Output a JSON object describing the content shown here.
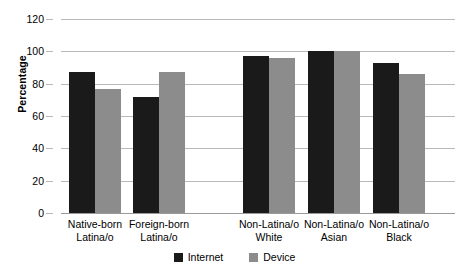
{
  "chart_data": {
    "type": "bar",
    "title": "",
    "xlabel": "",
    "ylabel": "Percentage",
    "ylim": [
      0,
      120
    ],
    "yticks": [
      0,
      20,
      40,
      60,
      80,
      100,
      120
    ],
    "grid": true,
    "legend_position": "bottom",
    "categories": [
      "Native-born Latina/o",
      "Foreign-born Latina/o",
      "Non-Latina/o White",
      "Non-Latina/o Asian",
      "Non-Latina/o Black"
    ],
    "category_lines": [
      [
        "Native-born",
        "Latina/o"
      ],
      [
        "Foreign-born",
        "Latina/o"
      ],
      [
        "Non-Latina/o",
        "White"
      ],
      [
        "Non-Latina/o",
        "Asian"
      ],
      [
        "Non-Latina/o",
        "Black"
      ]
    ],
    "series": [
      {
        "name": "Internet",
        "color": "#1a1a1a",
        "values": [
          87,
          72,
          97,
          100,
          93
        ]
      },
      {
        "name": "Device",
        "color": "#8c8c8c",
        "values": [
          77,
          87,
          96,
          100,
          86
        ]
      }
    ]
  },
  "axis": {
    "y_title": "Percentage",
    "y_tick_labels": [
      "120",
      "100",
      "80",
      "60",
      "40",
      "20",
      "0"
    ]
  },
  "legend": {
    "items": [
      {
        "label": "Internet",
        "color": "#1a1a1a"
      },
      {
        "label": "Device",
        "color": "#8c8c8c"
      }
    ]
  }
}
